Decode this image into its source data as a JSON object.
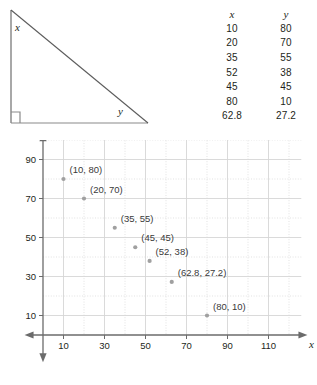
{
  "figure": {
    "triangle": {
      "name": "right-triangle",
      "angle_label_x": "x",
      "angle_label_y": "y",
      "right_angle_marker": "right-angle-square"
    }
  },
  "table": {
    "headers": [
      "x",
      "y"
    ],
    "rows": [
      [
        "10",
        "80"
      ],
      [
        "20",
        "70"
      ],
      [
        "35",
        "55"
      ],
      [
        "52",
        "38"
      ],
      [
        "45",
        "45"
      ],
      [
        "80",
        "10"
      ],
      [
        "62.8",
        "27.2"
      ]
    ]
  },
  "chart_data": {
    "type": "scatter",
    "title": "",
    "xlabel": "x",
    "ylabel": "y",
    "xlim": [
      0,
      120
    ],
    "ylim": [
      0,
      100
    ],
    "xticks": [
      10,
      30,
      50,
      70,
      90,
      110
    ],
    "xtick_labels": [
      "10",
      "30",
      "50",
      "70",
      "90",
      "110"
    ],
    "yticks": [
      10,
      30,
      50,
      70,
      90
    ],
    "ytick_labels": [
      "10",
      "30",
      "50",
      "70",
      "90"
    ],
    "grid": true,
    "grid_step_x": 10,
    "grid_step_y": 10,
    "legend": "none",
    "marker_color": "#a0a0a0",
    "axis_color": "#6b6b6b",
    "grid_color": "#d6d6d6",
    "points": [
      {
        "x": 10,
        "y": 80,
        "label": "(10, 80)",
        "label_dx": 6,
        "label_dy": -6
      },
      {
        "x": 20,
        "y": 70,
        "label": "(20, 70)",
        "label_dx": 6,
        "label_dy": -6
      },
      {
        "x": 35,
        "y": 55,
        "label": "(35, 55)",
        "label_dx": 6,
        "label_dy": -6
      },
      {
        "x": 45,
        "y": 45,
        "label": "(45, 45)",
        "label_dx": 6,
        "label_dy": -6
      },
      {
        "x": 52,
        "y": 38,
        "label": "(52, 38)",
        "label_dx": 6,
        "label_dy": -6
      },
      {
        "x": 62.8,
        "y": 27.2,
        "label": "(62.8, 27.2)",
        "label_dx": 6,
        "label_dy": -6
      },
      {
        "x": 80,
        "y": 10,
        "label": "(80, 10)",
        "label_dx": 6,
        "label_dy": -6
      }
    ]
  }
}
